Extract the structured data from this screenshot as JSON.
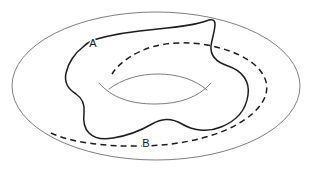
{
  "figure": {
    "name": "torus-with-two-cycles",
    "background_color": "#ffffff",
    "width": 313,
    "height": 172,
    "surface": {
      "name": "torus-outer-boundary",
      "shape": "ellipse",
      "center_x": 156,
      "center_y": 86,
      "radius_x": 144,
      "radius_y": 74,
      "stroke_color": "#6f6f72",
      "stroke_width": 0.9
    },
    "hole": {
      "name": "torus-inner-hole",
      "stroke_color": "#6f6f72",
      "stroke_width": 0.9,
      "back_edge_path": "M 99 83 C 112 98 131 104 155 104 C 180 104 199 97 211 83",
      "front_edge_path": "M 109 89 C 122 79 140 74 158 74 C 178 74 196 80 207 90"
    },
    "curves": [
      {
        "id": "A",
        "name": "cycle-a-solid",
        "label": "A",
        "label_x": 93,
        "label_y": 44,
        "style": "solid",
        "stroke_color": "#1c1c1e",
        "stroke_width": 1.5,
        "description": "solid closed loop encircling the torus tube",
        "path": "M 93 40 C 110 35 134 31 158 29 C 178 27 196 25 206 21 C 211 19 215 19 215 24 C 215 31 212 38 211 46 C 210 56 216 62 228 66 C 243 71 250 82 248 95 C 246 110 236 121 221 127 C 207 133 192 130 182 124 C 170 117 161 119 152 124 C 140 131 126 136 113 138 C 102 140 94 138 89 133 C 84 128 83 121 84 113 C 85 104 82 98 76 94 C 68 89 64 82 66 73 C 68 63 75 53 83 47 C 86 44 89 42 93 40 Z"
      },
      {
        "id": "B",
        "name": "cycle-b-dashed",
        "label": "B",
        "label_x": 146,
        "label_y": 144,
        "style": "dashed",
        "stroke_color": "#1c1c1e",
        "stroke_width": 1.5,
        "dash_pattern": "6 4.2",
        "description": "dashed closed loop passing through the torus hole",
        "path": "M 51 133 C 70 142 104 147 143 146 C 186 145 224 135 247 118 C 266 104 272 88 262 73 C 252 58 228 48 201 44 C 177 41 156 44 141 51 C 126 58 117 66 112 74"
      }
    ]
  }
}
